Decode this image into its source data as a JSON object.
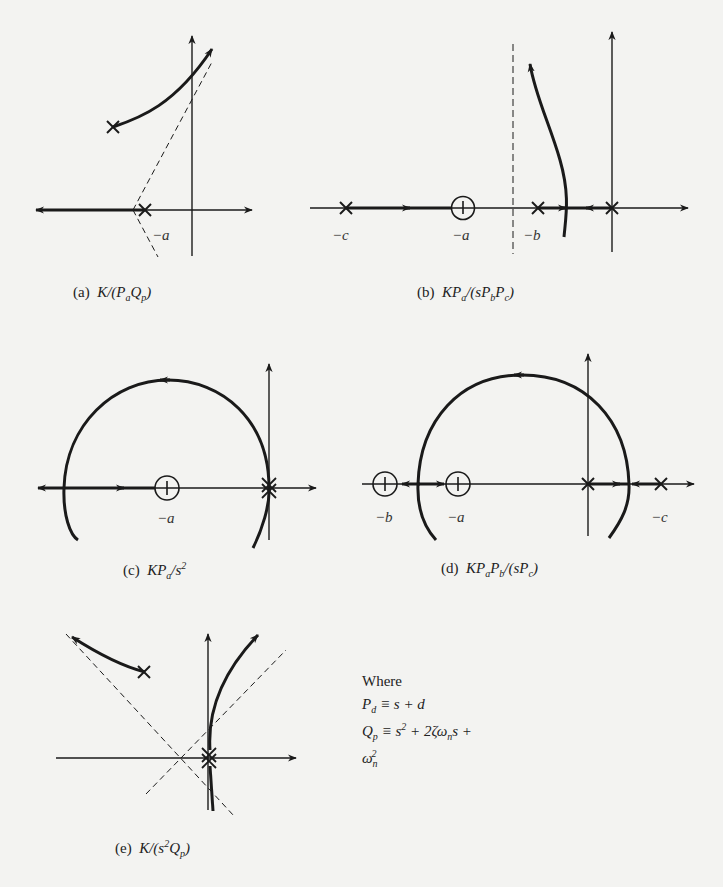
{
  "figure": {
    "background": "#f3f3f1",
    "ink": "#1a1a1a",
    "plots": [
      {
        "id": "a",
        "caption_tag": "(a)",
        "caption_parts": [
          [
            "K/(P",
            ""
          ],
          [
            "a",
            "sub"
          ],
          [
            "Q",
            ""
          ],
          [
            "p",
            "sub"
          ],
          [
            ")",
            ""
          ]
        ],
        "caption_text": "(a) K/(P_a Q_p)",
        "labels": [
          {
            "text": "−a",
            "x": 152,
            "y": 227
          }
        ],
        "poles": [
          "complex pair (upper shown at x)",
          "-a"
        ],
        "zeros": []
      },
      {
        "id": "b",
        "caption_tag": "(b)",
        "caption_parts": [
          [
            "KP",
            ""
          ],
          [
            "a",
            "sub"
          ],
          [
            "/(sP",
            ""
          ],
          [
            "b",
            "sub"
          ],
          [
            "P",
            ""
          ],
          [
            "c",
            "sub"
          ],
          [
            ")",
            ""
          ]
        ],
        "caption_text": "(b) KP_a/(sP_bP_c)",
        "labels": [
          {
            "text": "−c",
            "x": 332,
            "y": 227
          },
          {
            "text": "−a",
            "x": 452,
            "y": 227
          },
          {
            "text": "−b",
            "x": 523,
            "y": 227
          }
        ],
        "poles": [
          "-c",
          "-b",
          "0"
        ],
        "zeros": [
          "-a"
        ]
      },
      {
        "id": "c",
        "caption_tag": "(c)",
        "caption_parts": [
          [
            "KP",
            ""
          ],
          [
            "a",
            "sub"
          ],
          [
            "/s",
            ""
          ],
          [
            "2",
            "sup"
          ]
        ],
        "caption_text": "(c) KP_a/s^2",
        "labels": [
          {
            "text": "−a",
            "x": 157,
            "y": 510
          }
        ],
        "poles": [
          "0 (double)"
        ],
        "zeros": [
          "-a"
        ]
      },
      {
        "id": "d",
        "caption_tag": "(d)",
        "caption_parts": [
          [
            "KP",
            ""
          ],
          [
            "a",
            "sub"
          ],
          [
            "P",
            ""
          ],
          [
            "b",
            "sub"
          ],
          [
            "/(sP",
            ""
          ],
          [
            "c",
            "sub"
          ],
          [
            ")",
            ""
          ]
        ],
        "caption_text": "(d) KP_aP_b/(sP_c)",
        "labels": [
          {
            "text": "−b",
            "x": 375,
            "y": 509
          },
          {
            "text": "−a",
            "x": 447,
            "y": 509
          },
          {
            "text": "−c",
            "x": 651,
            "y": 509
          }
        ],
        "poles": [
          "0",
          "-c"
        ],
        "zeros": [
          "-b",
          "-a"
        ]
      },
      {
        "id": "e",
        "caption_tag": "(e)",
        "caption_parts": [
          [
            "K/(s",
            ""
          ],
          [
            "2",
            "sup"
          ],
          [
            "Q",
            ""
          ],
          [
            "p",
            "sub"
          ],
          [
            ")",
            ""
          ]
        ],
        "caption_text": "(e) K/(s^2 Q_p)",
        "labels": [],
        "poles": [
          "0 (double)",
          "complex pair (upper shown at x)"
        ],
        "zeros": []
      }
    ],
    "definitions": {
      "title": "Where",
      "pd_lhs": "P",
      "pd_sub": "d",
      "pd_rhs": " ≡ s + d",
      "qp_lhs": "Q",
      "qp_sub": "p",
      "qp_rhs_1": " ≡ s",
      "qp_sup_1": "2",
      "qp_rhs_2": " + 2ζω",
      "qp_sub_2": "n",
      "qp_rhs_3": "s + ω",
      "qp_sub_3": "n",
      "qp_sup_3": "2"
    }
  }
}
